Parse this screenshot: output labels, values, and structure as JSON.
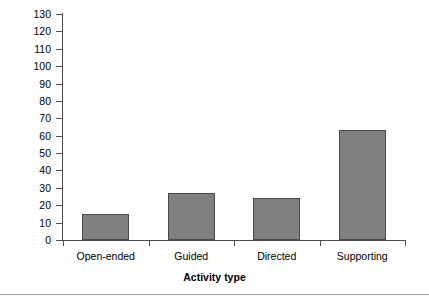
{
  "chart_data": {
    "type": "bar",
    "title": "",
    "subtitle": "",
    "categories": [
      "Open-ended",
      "Guided",
      "Directed",
      "Supporting"
    ],
    "values": [
      15,
      27,
      24,
      63
    ],
    "series": [
      {
        "name": "",
        "values": [
          15,
          27,
          24,
          63
        ]
      }
    ],
    "xlabel": "Activity type",
    "ylabel": "",
    "ylim": [
      0,
      130
    ],
    "ytick_step": 10,
    "yticks": [
      0,
      10,
      20,
      30,
      40,
      50,
      60,
      70,
      80,
      90,
      100,
      110,
      120,
      130
    ],
    "ytick_labels": [
      "0",
      "10",
      "20",
      "30",
      "40",
      "50",
      "60",
      "70",
      "80",
      "90",
      "100",
      "110",
      "120",
      "130"
    ],
    "grid": false,
    "legend": null,
    "legend_position": "none",
    "bar_color": "#808080",
    "bar_border_color": "#4a4a4a",
    "axis_color": "#4d4d4d",
    "background_color": "#ffffff",
    "annotations": []
  },
  "figure": {
    "bottom_rule_color": "#9a9a9a"
  }
}
